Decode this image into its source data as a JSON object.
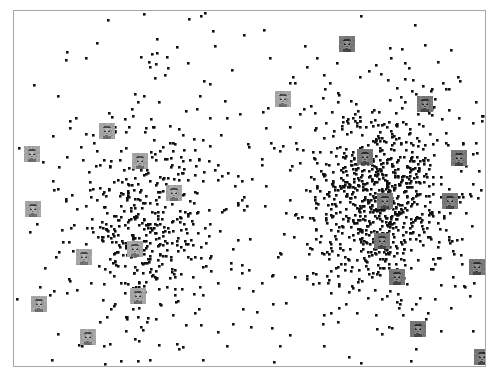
{
  "figure": {
    "title": "",
    "subtitle": "",
    "background_color": "#ffffff",
    "frame_color": "#a8a8a8",
    "frame": {
      "x": 13,
      "y": 10,
      "width": 473,
      "height": 357
    }
  },
  "chart_data": {
    "type": "scatter",
    "title": "",
    "xlabel": "",
    "ylabel": "",
    "xlim": [
      0,
      471
    ],
    "ylim": [
      0,
      355
    ],
    "grid": false,
    "axes_visible": false,
    "tick_labels": {
      "x": [],
      "y": []
    },
    "legend": {
      "entries": [],
      "position": "none"
    },
    "annotations": [],
    "point_style": {
      "color": "#111111",
      "marker": "square",
      "size_px": 2.6,
      "opacity": 1
    },
    "series": [
      {
        "name": "cluster-left",
        "color": "#111111",
        "count": 520,
        "center": [
          130,
          215
        ],
        "spread": [
          62,
          86
        ],
        "seed": 1337,
        "density_core": 0.55,
        "core_spread": [
          34,
          44
        ]
      },
      {
        "name": "cluster-right",
        "color": "#111111",
        "count": 980,
        "center": [
          365,
          190
        ],
        "spread": [
          74,
          96
        ],
        "seed": 2024,
        "density_core": 0.62,
        "core_spread": [
          30,
          40
        ]
      },
      {
        "name": "scatter-sparse-background",
        "color": "#111111",
        "count": 150,
        "center": [
          235,
          180
        ],
        "spread": [
          150,
          120
        ],
        "seed": 99,
        "density_core": 0,
        "core_spread": [
          0,
          0
        ]
      }
    ],
    "thumbnails": {
      "kind": "face-photo-thumbnail",
      "size_px": 16,
      "style": "grayscale",
      "items": [
        {
          "label": "face-thumb-left-1",
          "x": 10,
          "y": 135,
          "tone": "light"
        },
        {
          "label": "face-thumb-left-2",
          "x": 85,
          "y": 112,
          "tone": "light"
        },
        {
          "label": "face-thumb-left-3",
          "x": 118,
          "y": 142,
          "tone": "light"
        },
        {
          "label": "face-thumb-left-4",
          "x": 152,
          "y": 174,
          "tone": "light"
        },
        {
          "label": "face-thumb-left-5",
          "x": 11,
          "y": 190,
          "tone": "light"
        },
        {
          "label": "face-thumb-left-6",
          "x": 113,
          "y": 230,
          "tone": "light"
        },
        {
          "label": "face-thumb-left-7",
          "x": 62,
          "y": 238,
          "tone": "light"
        },
        {
          "label": "face-thumb-left-8",
          "x": 116,
          "y": 277,
          "tone": "light"
        },
        {
          "label": "face-thumb-left-9",
          "x": 17,
          "y": 285,
          "tone": "light"
        },
        {
          "label": "face-thumb-left-10",
          "x": 66,
          "y": 318,
          "tone": "light"
        },
        {
          "label": "face-thumb-mid-1",
          "x": 261,
          "y": 80,
          "tone": "light"
        },
        {
          "label": "face-thumb-right-1",
          "x": 325,
          "y": 25,
          "tone": "dark"
        },
        {
          "label": "face-thumb-right-2",
          "x": 403,
          "y": 85,
          "tone": "dark"
        },
        {
          "label": "face-thumb-right-3",
          "x": 343,
          "y": 138,
          "tone": "dark"
        },
        {
          "label": "face-thumb-right-4",
          "x": 437,
          "y": 139,
          "tone": "dark"
        },
        {
          "label": "face-thumb-right-5",
          "x": 363,
          "y": 182,
          "tone": "dark"
        },
        {
          "label": "face-thumb-right-6",
          "x": 428,
          "y": 182,
          "tone": "dark"
        },
        {
          "label": "face-thumb-right-7",
          "x": 360,
          "y": 222,
          "tone": "dark"
        },
        {
          "label": "face-thumb-right-8",
          "x": 375,
          "y": 258,
          "tone": "dark"
        },
        {
          "label": "face-thumb-right-9",
          "x": 455,
          "y": 248,
          "tone": "dark"
        },
        {
          "label": "face-thumb-right-10",
          "x": 396,
          "y": 310,
          "tone": "dark"
        },
        {
          "label": "face-thumb-right-11",
          "x": 460,
          "y": 338,
          "tone": "dark"
        }
      ]
    }
  }
}
